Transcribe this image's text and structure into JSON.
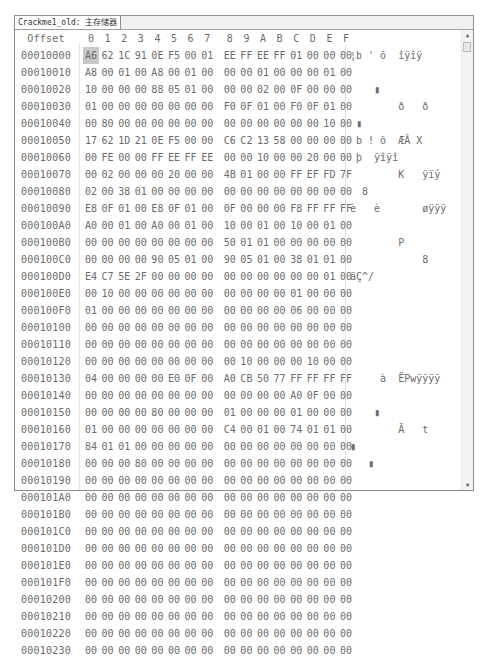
{
  "tab": {
    "label": "Crackme1_old: 主存储器"
  },
  "header": {
    "offset_label": "Offset",
    "columns": [
      "0",
      "1",
      "2",
      "3",
      "4",
      "5",
      "6",
      "7",
      "8",
      "9",
      "A",
      "B",
      "C",
      "D",
      "E",
      "F"
    ]
  },
  "rows": [
    {
      "offset": "00010000",
      "bytes": [
        "A6",
        "62",
        "1C",
        "91",
        "0E",
        "F5",
        "00",
        "01",
        "EE",
        "FF",
        "EE",
        "FF",
        "01",
        "00",
        "00",
        "00"
      ],
      "ascii": "¦b ' õ  îÿîÿ"
    },
    {
      "offset": "00010010",
      "bytes": [
        "A8",
        "00",
        "01",
        "00",
        "A8",
        "00",
        "01",
        "00",
        "00",
        "00",
        "01",
        "00",
        "00",
        "00",
        "01",
        "00"
      ],
      "ascii": ""
    },
    {
      "offset": "00010020",
      "bytes": [
        "10",
        "00",
        "00",
        "00",
        "88",
        "05",
        "01",
        "00",
        "00",
        "00",
        "02",
        "00",
        "0F",
        "00",
        "00",
        "00"
      ],
      "ascii": "    ▮"
    },
    {
      "offset": "00010030",
      "bytes": [
        "01",
        "00",
        "00",
        "00",
        "00",
        "00",
        "00",
        "00",
        "F0",
        "0F",
        "01",
        "00",
        "F0",
        "0F",
        "01",
        "00"
      ],
      "ascii": "        ð   ð"
    },
    {
      "offset": "00010040",
      "bytes": [
        "00",
        "80",
        "00",
        "00",
        "00",
        "00",
        "00",
        "00",
        "00",
        "00",
        "00",
        "00",
        "00",
        "00",
        "10",
        "00"
      ],
      "ascii": " ▮"
    },
    {
      "offset": "00010050",
      "bytes": [
        "17",
        "62",
        "1D",
        "21",
        "0E",
        "F5",
        "00",
        "00",
        "C6",
        "C2",
        "13",
        "58",
        "00",
        "00",
        "00",
        "00"
      ],
      "ascii": " b ! õ  ÆÂ X"
    },
    {
      "offset": "00010060",
      "bytes": [
        "00",
        "FE",
        "00",
        "00",
        "FF",
        "EE",
        "FF",
        "EE",
        "00",
        "00",
        "10",
        "00",
        "00",
        "20",
        "00",
        "00"
      ],
      "ascii": " þ  ÿîÿî"
    },
    {
      "offset": "00010070",
      "bytes": [
        "00",
        "02",
        "00",
        "00",
        "00",
        "20",
        "00",
        "00",
        "4B",
        "01",
        "00",
        "00",
        "FF",
        "EF",
        "FD",
        "7F"
      ],
      "ascii": "        K   ÿïý"
    },
    {
      "offset": "00010080",
      "bytes": [
        "02",
        "00",
        "38",
        "01",
        "00",
        "00",
        "00",
        "00",
        "00",
        "00",
        "00",
        "00",
        "00",
        "00",
        "00",
        "00"
      ],
      "ascii": "  8"
    },
    {
      "offset": "00010090",
      "bytes": [
        "E8",
        "0F",
        "01",
        "00",
        "E8",
        "0F",
        "01",
        "00",
        "0F",
        "00",
        "00",
        "00",
        "F8",
        "FF",
        "FF",
        "FF"
      ],
      "ascii": "è   è       øÿÿÿ"
    },
    {
      "offset": "000100A0",
      "bytes": [
        "A0",
        "00",
        "01",
        "00",
        "A0",
        "00",
        "01",
        "00",
        "10",
        "00",
        "01",
        "00",
        "10",
        "00",
        "01",
        "00"
      ],
      "ascii": ""
    },
    {
      "offset": "000100B0",
      "bytes": [
        "00",
        "00",
        "00",
        "00",
        "00",
        "00",
        "00",
        "00",
        "50",
        "01",
        "01",
        "00",
        "00",
        "00",
        "00",
        "00"
      ],
      "ascii": "        P"
    },
    {
      "offset": "000100C0",
      "bytes": [
        "00",
        "00",
        "00",
        "00",
        "90",
        "05",
        "01",
        "00",
        "90",
        "05",
        "01",
        "00",
        "38",
        "01",
        "01",
        "00"
      ],
      "ascii": "            8"
    },
    {
      "offset": "000100D0",
      "bytes": [
        "E4",
        "C7",
        "5E",
        "2F",
        "00",
        "00",
        "00",
        "00",
        "00",
        "00",
        "00",
        "00",
        "00",
        "00",
        "01",
        "00"
      ],
      "ascii": "äÇ^/"
    },
    {
      "offset": "000100E0",
      "bytes": [
        "00",
        "10",
        "00",
        "00",
        "00",
        "00",
        "00",
        "00",
        "00",
        "00",
        "00",
        "00",
        "01",
        "00",
        "00",
        "00"
      ],
      "ascii": ""
    },
    {
      "offset": "000100F0",
      "bytes": [
        "01",
        "00",
        "00",
        "00",
        "00",
        "00",
        "00",
        "00",
        "00",
        "00",
        "00",
        "00",
        "06",
        "00",
        "00",
        "00"
      ],
      "ascii": ""
    },
    {
      "offset": "00010100",
      "bytes": [
        "00",
        "00",
        "00",
        "00",
        "00",
        "00",
        "00",
        "00",
        "00",
        "00",
        "00",
        "00",
        "00",
        "00",
        "00",
        "00"
      ],
      "ascii": ""
    },
    {
      "offset": "00010110",
      "bytes": [
        "00",
        "00",
        "00",
        "00",
        "00",
        "00",
        "00",
        "00",
        "00",
        "00",
        "00",
        "00",
        "00",
        "00",
        "00",
        "00"
      ],
      "ascii": ""
    },
    {
      "offset": "00010120",
      "bytes": [
        "00",
        "00",
        "00",
        "00",
        "00",
        "00",
        "00",
        "00",
        "00",
        "10",
        "00",
        "00",
        "00",
        "10",
        "00",
        "00"
      ],
      "ascii": ""
    },
    {
      "offset": "00010130",
      "bytes": [
        "04",
        "00",
        "00",
        "00",
        "00",
        "E0",
        "0F",
        "00",
        "A0",
        "CB",
        "50",
        "77",
        "FF",
        "FF",
        "FF",
        "FF"
      ],
      "ascii": "     à  ËPwÿÿÿÿ"
    },
    {
      "offset": "00010140",
      "bytes": [
        "00",
        "00",
        "00",
        "00",
        "00",
        "00",
        "00",
        "00",
        "00",
        "00",
        "00",
        "00",
        "A0",
        "0F",
        "00",
        "00"
      ],
      "ascii": ""
    },
    {
      "offset": "00010150",
      "bytes": [
        "00",
        "00",
        "00",
        "00",
        "80",
        "00",
        "00",
        "00",
        "01",
        "00",
        "00",
        "00",
        "01",
        "00",
        "00",
        "00"
      ],
      "ascii": "    ▮"
    },
    {
      "offset": "00010160",
      "bytes": [
        "01",
        "00",
        "00",
        "00",
        "00",
        "00",
        "00",
        "00",
        "C4",
        "00",
        "01",
        "00",
        "74",
        "01",
        "01",
        "00"
      ],
      "ascii": "        Ä   t"
    },
    {
      "offset": "00010170",
      "bytes": [
        "84",
        "01",
        "01",
        "00",
        "00",
        "00",
        "00",
        "00",
        "00",
        "00",
        "00",
        "00",
        "00",
        "00",
        "00",
        "00"
      ],
      "ascii": "▮"
    },
    {
      "offset": "00010180",
      "bytes": [
        "00",
        "00",
        "00",
        "80",
        "00",
        "00",
        "00",
        "00",
        "00",
        "00",
        "00",
        "00",
        "00",
        "00",
        "00",
        "00"
      ],
      "ascii": "   ▮"
    },
    {
      "offset": "00010190",
      "bytes": [
        "00",
        "00",
        "00",
        "00",
        "00",
        "00",
        "00",
        "00",
        "00",
        "00",
        "00",
        "00",
        "00",
        "00",
        "00",
        "00"
      ],
      "ascii": ""
    },
    {
      "offset": "000101A0",
      "bytes": [
        "00",
        "00",
        "00",
        "00",
        "00",
        "00",
        "00",
        "00",
        "00",
        "00",
        "00",
        "00",
        "00",
        "00",
        "00",
        "00"
      ],
      "ascii": ""
    },
    {
      "offset": "000101B0",
      "bytes": [
        "00",
        "00",
        "00",
        "00",
        "00",
        "00",
        "00",
        "00",
        "00",
        "00",
        "00",
        "00",
        "00",
        "00",
        "00",
        "00"
      ],
      "ascii": ""
    },
    {
      "offset": "000101C0",
      "bytes": [
        "00",
        "00",
        "00",
        "00",
        "00",
        "00",
        "00",
        "00",
        "00",
        "00",
        "00",
        "00",
        "00",
        "00",
        "00",
        "00"
      ],
      "ascii": ""
    },
    {
      "offset": "000101D0",
      "bytes": [
        "00",
        "00",
        "00",
        "00",
        "00",
        "00",
        "00",
        "00",
        "00",
        "00",
        "00",
        "00",
        "00",
        "00",
        "00",
        "00"
      ],
      "ascii": ""
    },
    {
      "offset": "000101E0",
      "bytes": [
        "00",
        "00",
        "00",
        "00",
        "00",
        "00",
        "00",
        "00",
        "00",
        "00",
        "00",
        "00",
        "00",
        "00",
        "00",
        "00"
      ],
      "ascii": ""
    },
    {
      "offset": "000101F0",
      "bytes": [
        "00",
        "00",
        "00",
        "00",
        "00",
        "00",
        "00",
        "00",
        "00",
        "00",
        "00",
        "00",
        "00",
        "00",
        "00",
        "00"
      ],
      "ascii": ""
    },
    {
      "offset": "00010200",
      "bytes": [
        "00",
        "00",
        "00",
        "00",
        "00",
        "00",
        "00",
        "00",
        "00",
        "00",
        "00",
        "00",
        "00",
        "00",
        "00",
        "00"
      ],
      "ascii": ""
    },
    {
      "offset": "00010210",
      "bytes": [
        "00",
        "00",
        "00",
        "00",
        "00",
        "00",
        "00",
        "00",
        "00",
        "00",
        "00",
        "00",
        "00",
        "00",
        "00",
        "00"
      ],
      "ascii": ""
    },
    {
      "offset": "00010220",
      "bytes": [
        "00",
        "00",
        "00",
        "00",
        "00",
        "00",
        "00",
        "00",
        "00",
        "00",
        "00",
        "00",
        "00",
        "00",
        "00",
        "00"
      ],
      "ascii": ""
    },
    {
      "offset": "00010230",
      "bytes": [
        "00",
        "00",
        "00",
        "00",
        "00",
        "00",
        "00",
        "00",
        "00",
        "00",
        "00",
        "00",
        "00",
        "00",
        "00",
        "00"
      ],
      "ascii": ""
    }
  ],
  "scrollbar": {
    "up_icon": "▲",
    "down_icon": "▼"
  }
}
